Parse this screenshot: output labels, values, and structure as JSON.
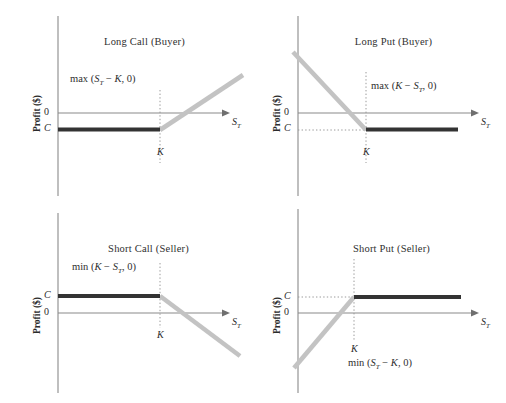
{
  "figure": {
    "ylabel": "Profit ($)",
    "xlabel_base": "S",
    "xlabel_sub": "T",
    "tick_zero": "0",
    "tick_premium": "C",
    "strike_label": "K",
    "colors": {
      "payoff_line": "#333333",
      "intrinsic_line": "#c3c3c3",
      "axis": "#8a8a8a",
      "dotted_guide": "#9a9a9a",
      "text": "#2b2b2b",
      "background": "#ffffff"
    }
  },
  "panels": [
    {
      "id": "long-call-buyer",
      "title": "Long Call (Buyer)",
      "formula_prefix": "max (",
      "formula_body_a": "S",
      "formula_sub_a": "T",
      "formula_op": " − ",
      "formula_body_b": "K",
      "formula_suffix": ", 0)",
      "formula_full": "max (Sₜ − K, 0)",
      "ylabel": "Profit ($)",
      "tick_top": "0",
      "tick_bottom": "C",
      "strike_label": "K",
      "xlabel": "Sₜ"
    },
    {
      "id": "long-put-buyer",
      "title": "Long Put (Buyer)",
      "formula_prefix": "max (",
      "formula_body_a": "K",
      "formula_sub_a": "",
      "formula_op": " − ",
      "formula_body_b": "S",
      "formula_sub_b": "T",
      "formula_suffix": ", 0)",
      "formula_full": "max (K − Sₜ, 0)",
      "ylabel": "Profit ($)",
      "tick_top": "0",
      "tick_bottom": "C",
      "strike_label": "K",
      "xlabel": "Sₜ"
    },
    {
      "id": "short-call-seller",
      "title": "Short Call (Seller)",
      "formula_prefix": "min (",
      "formula_body_a": "K",
      "formula_sub_a": "",
      "formula_op": " − ",
      "formula_body_b": "S",
      "formula_sub_b": "T",
      "formula_suffix": ", 0)",
      "formula_full": "min (K − Sₜ, 0)",
      "ylabel": "Profit ($)",
      "tick_top": "C",
      "tick_bottom": "0",
      "strike_label": "K",
      "xlabel": "Sₜ"
    },
    {
      "id": "short-put-seller",
      "title": "Short Put (Seller)",
      "formula_prefix": "min (",
      "formula_body_a": "S",
      "formula_sub_a": "T",
      "formula_op": " − ",
      "formula_body_b": "K",
      "formula_suffix": ", 0)",
      "formula_full": "min (Sₜ − K, 0)",
      "ylabel": "Profit ($)",
      "tick_top": "C",
      "tick_bottom": "0",
      "strike_label": "K",
      "xlabel": "Sₜ"
    }
  ],
  "chart_data": {
    "type": "line",
    "xlabel": "S_T (underlying price at expiration)",
    "ylabel": "Profit ($)",
    "grid": false,
    "legend": "none",
    "panel_count": 4,
    "charts": [
      {
        "name": "Long Call (Buyer)",
        "annotation": "max (S_T - K, 0)",
        "x_markers": [
          {
            "label": "K",
            "style": "dotted-vertical"
          }
        ],
        "y_markers": [
          {
            "label": "0",
            "value": 0
          },
          {
            "label": "C",
            "value": -1,
            "note": "premium paid, below zero"
          }
        ],
        "series": [
          {
            "name": "profit",
            "color": "#333333",
            "style": "thick-solid",
            "points": [
              {
                "x": 0,
                "y": -1
              },
              {
                "x": "K",
                "y": -1
              }
            ],
            "note": "flat at -C for S_T below K"
          },
          {
            "name": "intrinsic",
            "color": "#c3c3c3",
            "style": "thick-solid",
            "points": [
              {
                "x": "K",
                "y": -1
              },
              {
                "x": "max",
                "y": 2.2
              }
            ],
            "note": "rising 45-degree line from K upward"
          }
        ]
      },
      {
        "name": "Long Put (Buyer)",
        "annotation": "max (K - S_T, 0)",
        "x_markers": [
          {
            "label": "K",
            "style": "dotted-vertical"
          }
        ],
        "y_markers": [
          {
            "label": "0",
            "value": 0
          },
          {
            "label": "C",
            "value": -1,
            "note": "premium paid, dotted guide to K"
          }
        ],
        "series": [
          {
            "name": "intrinsic",
            "color": "#c3c3c3",
            "style": "thick-solid",
            "points": [
              {
                "x": 0,
                "y": 2.2
              },
              {
                "x": "K",
                "y": -1
              }
            ],
            "note": "falling line from top-left down to K"
          },
          {
            "name": "profit",
            "color": "#333333",
            "style": "thick-solid",
            "points": [
              {
                "x": "K",
                "y": -1
              },
              {
                "x": "max",
                "y": -1
              }
            ],
            "note": "flat at -C for S_T above K"
          }
        ]
      },
      {
        "name": "Short Call (Seller)",
        "annotation": "min (K - S_T, 0)",
        "x_markers": [
          {
            "label": "K",
            "style": "dotted-vertical"
          }
        ],
        "y_markers": [
          {
            "label": "C",
            "value": 1,
            "note": "premium received, above zero"
          },
          {
            "label": "0",
            "value": 0
          }
        ],
        "series": [
          {
            "name": "profit",
            "color": "#333333",
            "style": "thick-solid",
            "points": [
              {
                "x": 0,
                "y": 1
              },
              {
                "x": "K",
                "y": 1
              }
            ],
            "note": "flat at +C for S_T below K"
          },
          {
            "name": "intrinsic",
            "color": "#c3c3c3",
            "style": "thick-solid",
            "points": [
              {
                "x": "K",
                "y": 1
              },
              {
                "x": "max",
                "y": -2.0
              }
            ],
            "note": "falling line from K downward"
          }
        ]
      },
      {
        "name": "Short Put (Seller)",
        "annotation": "min (S_T - K, 0)",
        "x_markers": [
          {
            "label": "K",
            "style": "dotted-vertical"
          }
        ],
        "y_markers": [
          {
            "label": "C",
            "value": 1,
            "note": "premium received, dotted guide to K"
          },
          {
            "label": "0",
            "value": 0
          }
        ],
        "series": [
          {
            "name": "intrinsic",
            "color": "#c3c3c3",
            "style": "thick-solid",
            "points": [
              {
                "x": 0,
                "y": -2.0
              },
              {
                "x": "K",
                "y": 1
              }
            ],
            "note": "rising line from bottom-left up to K"
          },
          {
            "name": "profit",
            "color": "#333333",
            "style": "thick-solid",
            "points": [
              {
                "x": "K",
                "y": 1
              },
              {
                "x": "max",
                "y": 1
              }
            ],
            "note": "flat at +C for S_T above K"
          }
        ]
      }
    ]
  }
}
